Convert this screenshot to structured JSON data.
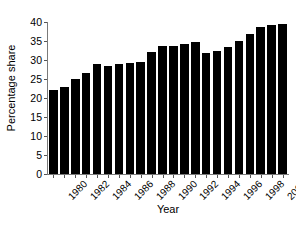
{
  "chart_data": {
    "type": "bar",
    "title": "",
    "xlabel": "Year",
    "ylabel": "Percentage share",
    "categories": [
      1980,
      1981,
      1982,
      1983,
      1984,
      1985,
      1986,
      1987,
      1988,
      1989,
      1990,
      1991,
      1992,
      1993,
      1994,
      1995,
      1996,
      1997,
      1998,
      1999,
      2000,
      2001
    ],
    "values": [
      22.0,
      23.0,
      25.0,
      26.7,
      28.9,
      28.5,
      29.0,
      29.3,
      29.6,
      32.0,
      33.8,
      33.8,
      34.3,
      34.8,
      31.8,
      32.5,
      33.3,
      35.0,
      36.8,
      38.8,
      39.3,
      39.6
    ],
    "ylim": [
      0,
      40
    ],
    "yticks": [
      0,
      5,
      10,
      15,
      20,
      25,
      30,
      35,
      40
    ],
    "ytick_labels": [
      "0",
      "5",
      "10",
      "15",
      "20",
      "25",
      "30",
      "35",
      "40"
    ],
    "xtick_labels": [
      "1980",
      "1982",
      "1984",
      "1986",
      "1988",
      "1990",
      "1992",
      "1994",
      "1996",
      "1998",
      "2000"
    ],
    "xtick_values": [
      1980,
      1982,
      1984,
      1986,
      1988,
      1990,
      1992,
      1994,
      1996,
      1998,
      2000
    ],
    "grid": false,
    "legend": null,
    "bar_color": "#000000",
    "axis_color": "#7a7a7a",
    "xtick_label_rotation": -45
  }
}
